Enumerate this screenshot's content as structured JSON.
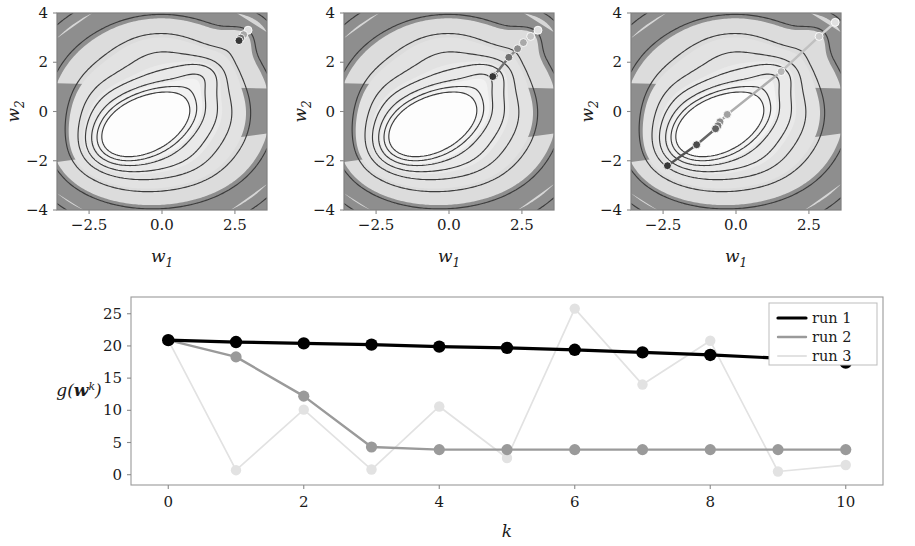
{
  "figure": {
    "background": "#ffffff",
    "panels": [
      {
        "name": "contour-panel-run-1",
        "xlabel": "w_1",
        "ylabel": "w_2",
        "xticks": [
          -2.5,
          0.0,
          2.5
        ],
        "xtick_labels": [
          "-2.5",
          "0.0",
          "2.5"
        ],
        "yticks": [
          -4,
          -2,
          0,
          2,
          4
        ],
        "ytick_labels": [
          "-4",
          "-2",
          "0",
          "2",
          "4"
        ],
        "xlim": [
          -3.6,
          3.6
        ],
        "ylim": [
          -4.0,
          4.0
        ],
        "trajectory_color": "#3a3a3a",
        "trajectory": [
          [
            2.95,
            3.3
          ],
          [
            2.8,
            3.12
          ],
          [
            2.7,
            2.98
          ],
          [
            2.64,
            2.88
          ]
        ]
      },
      {
        "name": "contour-panel-run-2",
        "xlabel": "w_1",
        "ylabel": "w_2",
        "xticks": [
          -2.5,
          0.0,
          2.5
        ],
        "xtick_labels": [
          "-2.5",
          "0.0",
          "2.5"
        ],
        "yticks": [
          -4,
          -2,
          0,
          2,
          4
        ],
        "ytick_labels": [
          "-4",
          "-2",
          "0",
          "2",
          "4"
        ],
        "xlim": [
          -3.6,
          3.6
        ],
        "ylim": [
          -4.0,
          4.0
        ],
        "trajectory_color": "#9a9a9a",
        "trajectory": [
          [
            3.05,
            3.3
          ],
          [
            2.8,
            3.05
          ],
          [
            2.55,
            2.8
          ],
          [
            2.35,
            2.55
          ],
          [
            2.05,
            2.2
          ],
          [
            1.55,
            1.45
          ],
          [
            1.5,
            1.42
          ]
        ]
      },
      {
        "name": "contour-panel-run-3",
        "xlabel": "w_1",
        "ylabel": "w_2",
        "xticks": [
          -2.5,
          0.0,
          2.5
        ],
        "xtick_labels": [
          "-2.5",
          "0.0",
          "2.5"
        ],
        "yticks": [
          -4,
          -2,
          0,
          2,
          4
        ],
        "ytick_labels": [
          "-4",
          "-2",
          "0",
          "2",
          "4"
        ],
        "xlim": [
          -3.6,
          3.6
        ],
        "ylim": [
          -4.0,
          4.0
        ],
        "trajectory_color": "#b5b5b5",
        "trajectory": [
          [
            3.4,
            3.62
          ],
          [
            2.85,
            3.05
          ],
          [
            1.55,
            1.62
          ],
          [
            -0.3,
            -0.12
          ],
          [
            -0.55,
            -0.42
          ],
          [
            -0.62,
            -0.58
          ],
          [
            -0.7,
            -0.7
          ],
          [
            -1.35,
            -1.35
          ],
          [
            -2.35,
            -2.2
          ]
        ]
      }
    ]
  },
  "chart_data": {
    "type": "line",
    "title": "",
    "xlabel": "k",
    "ylabel": "g(w^k)",
    "x": [
      0,
      1,
      2,
      3,
      4,
      5,
      6,
      7,
      8,
      9,
      10
    ],
    "xticks": [
      0,
      2,
      4,
      6,
      8,
      10
    ],
    "xtick_labels": [
      "0",
      "2",
      "4",
      "6",
      "8",
      "10"
    ],
    "yticks": [
      0,
      5,
      10,
      15,
      20,
      25
    ],
    "ytick_labels": [
      "0",
      "5",
      "10",
      "15",
      "20",
      "25"
    ],
    "xlim": [
      -0.55,
      10.55
    ],
    "ylim": [
      -1.6,
      27.6
    ],
    "grid": false,
    "legend_position": "top-right",
    "series": [
      {
        "name": "run 1",
        "color": "#000000",
        "linewidth": 3.2,
        "marker_size": 6.2,
        "values": [
          20.9,
          20.6,
          20.4,
          20.2,
          19.9,
          19.7,
          19.4,
          19.0,
          18.6,
          18.1,
          17.4
        ]
      },
      {
        "name": "run 2",
        "color": "#9a9a9a",
        "linewidth": 2.4,
        "marker_size": 5.6,
        "values": [
          20.9,
          18.3,
          12.2,
          4.3,
          3.9,
          3.9,
          3.9,
          3.9,
          3.9,
          3.9,
          3.9
        ]
      },
      {
        "name": "run 3",
        "color": "#e2e2e2",
        "linewidth": 1.7,
        "marker_size": 5.2,
        "values": [
          20.9,
          0.7,
          10.1,
          0.8,
          10.6,
          2.6,
          25.8,
          14.0,
          20.8,
          0.5,
          1.5
        ]
      }
    ]
  }
}
